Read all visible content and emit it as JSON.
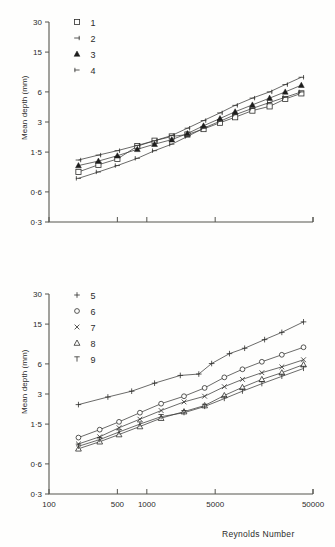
{
  "figure": {
    "background": "#fefefd",
    "ink": "#2b2b2b"
  },
  "axes": {
    "ylabel": "Mean depth  (mm)",
    "xlabel": "Reynolds  Number",
    "y_ticks": [
      "30",
      "15",
      "6",
      "3",
      "1·5",
      "0·6",
      "0·3"
    ],
    "y_tick_values": [
      30,
      15,
      6,
      3,
      1.5,
      0.6,
      0.3
    ],
    "x_ticks": [
      "100",
      "500",
      "1000",
      "5000",
      "50000"
    ],
    "x_tick_values": [
      100,
      500,
      1000,
      5000,
      50000
    ]
  },
  "chart_data": [
    {
      "id": "top-panel",
      "type": "line",
      "title": "",
      "xlabel": "",
      "ylabel": "Mean depth  (mm)",
      "xscale": "log",
      "yscale": "log",
      "xlim": [
        100,
        50000
      ],
      "ylim": [
        0.3,
        30
      ],
      "grid": false,
      "legend_position": "top-left",
      "series": [
        {
          "name": "1",
          "marker": "open-square",
          "x": [
            200,
            320,
            500,
            800,
            1200,
            1800,
            2600,
            3800,
            5600,
            8000,
            12000,
            18000,
            26000,
            38000
          ],
          "y": [
            0.95,
            1.12,
            1.28,
            1.72,
            1.95,
            2.15,
            2.25,
            2.55,
            2.95,
            3.35,
            3.9,
            4.3,
            5.1,
            5.8
          ]
        },
        {
          "name": "2",
          "marker": "left-tick",
          "x": [
            200,
            320,
            500,
            800,
            1200,
            1800,
            2600,
            3800,
            5600,
            8000,
            12000,
            18000,
            26000,
            38000
          ],
          "y": [
            1.25,
            1.4,
            1.55,
            1.75,
            1.95,
            2.2,
            2.6,
            3.1,
            3.7,
            4.4,
            5.2,
            6.0,
            7.1,
            8.4
          ]
        },
        {
          "name": "3",
          "marker": "filled-triangle",
          "x": [
            200,
            320,
            500,
            800,
            1200,
            1800,
            2600,
            3800,
            5600,
            8000,
            12000,
            18000,
            26000,
            38000
          ],
          "y": [
            1.1,
            1.22,
            1.38,
            1.6,
            1.8,
            2.0,
            2.3,
            2.75,
            3.25,
            3.8,
            4.45,
            5.2,
            6.0,
            7.0
          ]
        },
        {
          "name": "4",
          "marker": "plus-tick",
          "x": [
            200,
            320,
            500,
            800,
            1200,
            1800,
            2600,
            3800,
            5600,
            8000,
            12000,
            18000,
            26000,
            38000
          ],
          "y": [
            0.82,
            0.95,
            1.1,
            1.3,
            1.55,
            1.8,
            2.15,
            2.6,
            3.05,
            3.55,
            4.1,
            4.7,
            5.3,
            6.0
          ]
        }
      ]
    },
    {
      "id": "bottom-panel",
      "type": "line",
      "title": "",
      "xlabel": "Reynolds  Number",
      "ylabel": "Mean depth  (mm)",
      "xscale": "log",
      "yscale": "log",
      "xlim": [
        100,
        50000
      ],
      "ylim": [
        0.3,
        30
      ],
      "grid": false,
      "legend_position": "top-left",
      "series": [
        {
          "name": "5",
          "marker": "plus",
          "x": [
            200,
            400,
            700,
            1200,
            2200,
            3400,
            4600,
            7000,
            10000,
            16000,
            24000,
            40000
          ],
          "y": [
            2.35,
            2.8,
            3.2,
            3.85,
            4.6,
            4.75,
            6.05,
            7.6,
            8.6,
            10.5,
            12.4,
            15.8
          ]
        },
        {
          "name": "6",
          "marker": "open-circle",
          "x": [
            200,
            330,
            520,
            850,
            1400,
            2400,
            3900,
            6200,
            9500,
            15000,
            24000,
            40000
          ],
          "y": [
            1.1,
            1.32,
            1.58,
            1.95,
            2.4,
            2.85,
            3.45,
            4.4,
            5.3,
            6.3,
            7.4,
            8.8
          ]
        },
        {
          "name": "7",
          "marker": "cross",
          "x": [
            200,
            330,
            520,
            850,
            1400,
            2400,
            3900,
            6200,
            9500,
            15000,
            24000,
            40000
          ],
          "y": [
            0.95,
            1.12,
            1.38,
            1.68,
            2.05,
            2.5,
            2.85,
            3.55,
            4.2,
            4.9,
            5.6,
            6.6
          ]
        },
        {
          "name": "8",
          "marker": "open-triangle",
          "x": [
            200,
            330,
            520,
            850,
            1400,
            2400,
            3900,
            6200,
            9500,
            15000,
            24000,
            40000
          ],
          "y": [
            0.85,
            1.0,
            1.18,
            1.42,
            1.72,
            2.0,
            2.3,
            2.9,
            3.5,
            4.2,
            4.9,
            5.9
          ]
        },
        {
          "name": "9",
          "marker": "tee",
          "x": [
            200,
            330,
            520,
            850,
            1400,
            2400,
            3900,
            6200,
            9500,
            15000,
            24000,
            40000
          ],
          "y": [
            0.9,
            1.05,
            1.25,
            1.5,
            1.78,
            1.95,
            2.25,
            2.7,
            3.2,
            3.8,
            4.5,
            5.4
          ]
        }
      ]
    }
  ],
  "legends": {
    "top": [
      {
        "label": "1",
        "marker": "open-square"
      },
      {
        "label": "2",
        "marker": "left-tick"
      },
      {
        "label": "3",
        "marker": "filled-triangle"
      },
      {
        "label": "4",
        "marker": "plus-tick"
      }
    ],
    "bottom": [
      {
        "label": "5",
        "marker": "plus"
      },
      {
        "label": "6",
        "marker": "open-circle"
      },
      {
        "label": "7",
        "marker": "cross"
      },
      {
        "label": "8",
        "marker": "open-triangle"
      },
      {
        "label": "9",
        "marker": "tee"
      }
    ]
  }
}
